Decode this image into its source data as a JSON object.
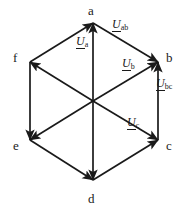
{
  "figure": {
    "kind": "phasor-hexagon-diagram",
    "width": 186,
    "height": 213,
    "background_color": "#ffffff",
    "line_color": "#1a1a1a",
    "text_color": "#1a1a1a"
  },
  "vertices": [
    {
      "id": "a",
      "label": "a",
      "x": 93,
      "y": 23,
      "label_x": 88,
      "label_y": 4
    },
    {
      "id": "b",
      "label": "b",
      "x": 158,
      "y": 62,
      "label_x": 166,
      "label_y": 51
    },
    {
      "id": "c",
      "label": "c",
      "x": 158,
      "y": 140,
      "label_x": 166,
      "label_y": 139
    },
    {
      "id": "d",
      "label": "d",
      "x": 93,
      "y": 180,
      "label_x": 88,
      "label_y": 192
    },
    {
      "id": "e",
      "label": "e",
      "x": 30,
      "y": 140,
      "label_x": 13,
      "label_y": 139
    },
    {
      "id": "f",
      "label": "f",
      "x": 30,
      "y": 62,
      "label_x": 13,
      "label_y": 51
    }
  ],
  "center": {
    "x": 93,
    "y": 101
  },
  "edges": [
    {
      "id": "f-a",
      "from": "f",
      "to": "a",
      "arrow_at": "a"
    },
    {
      "id": "a-b",
      "from": "a",
      "to": "b",
      "arrow_at": "b"
    },
    {
      "id": "c-b",
      "from": "c",
      "to": "b",
      "arrow_at": "b"
    },
    {
      "id": "d-c",
      "from": "d",
      "to": "c",
      "arrow_at": "c"
    },
    {
      "id": "e-d",
      "from": "e",
      "to": "d",
      "arrow_at": "d"
    },
    {
      "id": "f-e",
      "from": "f",
      "to": "e",
      "arrow_at": "e"
    }
  ],
  "diagonals": [
    {
      "id": "a-d",
      "from": "a",
      "to": "d",
      "arrow_at_both": true
    },
    {
      "id": "f-c",
      "from": "f",
      "to": "c",
      "arrow_at_both": true
    },
    {
      "id": "e-b",
      "from": "e",
      "to": "b",
      "arrow_at_both": true
    }
  ],
  "phasor_labels": [
    {
      "id": "U-a",
      "symbol": "U",
      "subscript": "a",
      "underlined": true,
      "x": 76,
      "y": 35
    },
    {
      "id": "U-ab",
      "symbol": "U",
      "subscript": "ab",
      "underlined": true,
      "x": 112,
      "y": 18
    },
    {
      "id": "U-b",
      "symbol": "U",
      "subscript": "b",
      "underlined": true,
      "x": 122,
      "y": 57
    },
    {
      "id": "U-bc",
      "symbol": "U",
      "subscript": "bc",
      "underlined": true,
      "x": 156,
      "y": 77
    },
    {
      "id": "U-c",
      "symbol": "U",
      "subscript": "c",
      "underlined": true,
      "x": 127,
      "y": 116
    }
  ]
}
